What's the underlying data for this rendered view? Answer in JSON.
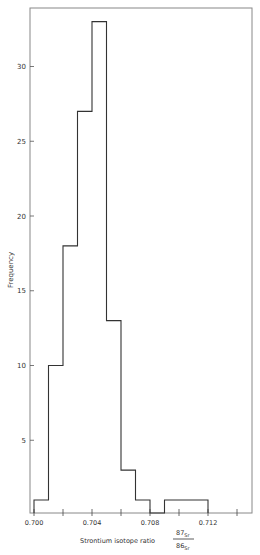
{
  "chart_data": {
    "type": "bar",
    "subtype": "histogram",
    "title": "",
    "xlabel": "Strontium isotope ratio",
    "xlabel_fraction": {
      "numerator": "87Sr",
      "denominator": "86Sr"
    },
    "ylabel": "Frequency",
    "xlim": [
      0.7,
      0.715
    ],
    "ylim": [
      0,
      34.5
    ],
    "x_ticks": [
      0.7,
      0.702,
      0.704,
      0.706,
      0.708,
      0.71,
      0.712,
      0.714
    ],
    "x_tick_labels": [
      "0.700",
      "",
      "0.704",
      "",
      "0.708",
      "",
      "0.712",
      ""
    ],
    "y_ticks": [
      5,
      10,
      15,
      20,
      25,
      30
    ],
    "y_tick_labels": [
      "5",
      "10",
      "15",
      "20",
      "25",
      "30"
    ],
    "bin_width": 0.001,
    "bins": [
      {
        "x0": 0.7,
        "x1": 0.701,
        "count": 1
      },
      {
        "x0": 0.701,
        "x1": 0.702,
        "count": 10
      },
      {
        "x0": 0.702,
        "x1": 0.703,
        "count": 18
      },
      {
        "x0": 0.703,
        "x1": 0.704,
        "count": 27
      },
      {
        "x0": 0.704,
        "x1": 0.705,
        "count": 33
      },
      {
        "x0": 0.705,
        "x1": 0.706,
        "count": 13
      },
      {
        "x0": 0.706,
        "x1": 0.707,
        "count": 3
      },
      {
        "x0": 0.707,
        "x1": 0.708,
        "count": 1
      },
      {
        "x0": 0.708,
        "x1": 0.709,
        "count": 0
      },
      {
        "x0": 0.709,
        "x1": 0.71,
        "count": 1
      },
      {
        "x0": 0.71,
        "x1": 0.711,
        "count": 1
      },
      {
        "x0": 0.711,
        "x1": 0.712,
        "count": 1
      }
    ],
    "categories": [
      "0.700",
      "0.701",
      "0.702",
      "0.703",
      "0.704",
      "0.705",
      "0.706",
      "0.707",
      "0.708",
      "0.709",
      "0.710",
      "0.711"
    ],
    "values": [
      1,
      10,
      18,
      27,
      33,
      13,
      3,
      1,
      0,
      1,
      1,
      1
    ],
    "grid": false,
    "legend": null,
    "line_color": "#333333"
  }
}
